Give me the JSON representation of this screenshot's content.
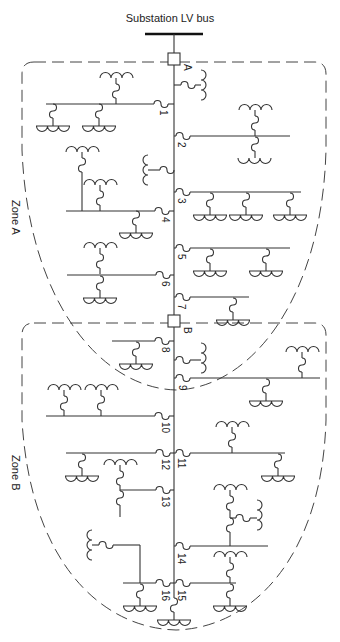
{
  "title": "Substation LV bus",
  "breakers": [
    {
      "id": "A",
      "label": "A"
    },
    {
      "id": "B",
      "label": "B"
    }
  ],
  "zones": [
    {
      "id": "zone-a",
      "label": "Zone A"
    },
    {
      "id": "zone-b",
      "label": "Zone B"
    }
  ],
  "nodes": [
    "1",
    "2",
    "3",
    "4",
    "5",
    "6",
    "7",
    "8",
    "9",
    "10",
    "11",
    "12",
    "13",
    "14",
    "15",
    "16"
  ],
  "colors": {
    "line": "#333333",
    "background": "#ffffff"
  }
}
